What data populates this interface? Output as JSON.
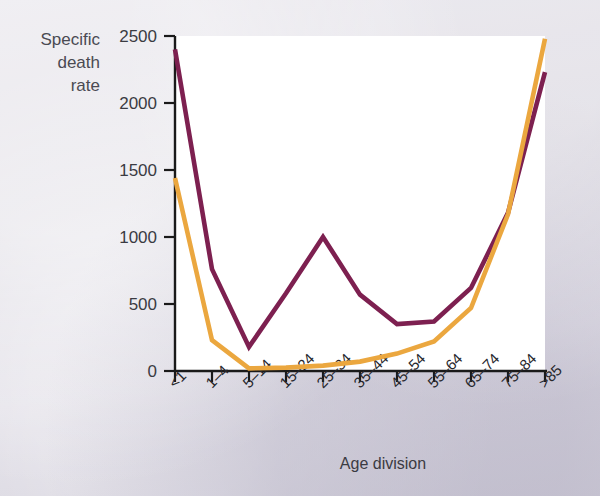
{
  "figure": {
    "y_axis_title_lines": [
      "Specific",
      "death",
      "rate"
    ],
    "x_axis_title": "Age division",
    "background_color": "#d7d5de",
    "plot_background_color": "#ffffff",
    "axis_color": "#1a1a1a"
  },
  "chart_data": {
    "type": "line",
    "title": "",
    "xlabel": "Age division",
    "ylabel": "Specific death rate",
    "categories": [
      "<1",
      "1–4",
      "5–14",
      "15–24",
      "25–34",
      "35–44",
      "45–54",
      "55–64",
      "65–74",
      "75–84",
      ">85"
    ],
    "ylim": [
      0,
      2500
    ],
    "yticks": [
      0,
      500,
      1000,
      1500,
      2000,
      2500
    ],
    "ytick_labels": [
      "0",
      "500",
      "1000",
      "1500",
      "2000",
      "2500"
    ],
    "grid": false,
    "legend": "none",
    "series": [
      {
        "name": "purple-series",
        "color": "#7d2050",
        "values": [
          2400,
          760,
          180,
          580,
          1000,
          570,
          350,
          370,
          620,
          1180,
          2230
        ]
      },
      {
        "name": "orange-series",
        "color": "#eba73f",
        "values": [
          1440,
          230,
          20,
          25,
          40,
          70,
          130,
          220,
          470,
          1170,
          2480
        ]
      }
    ]
  }
}
